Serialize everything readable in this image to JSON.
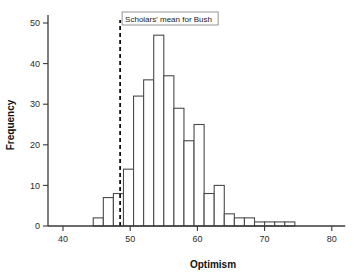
{
  "chart_data": {
    "type": "bar",
    "title": "",
    "subtitle": "",
    "xlabel": "Optimism",
    "ylabel": "Frequency",
    "xlim": [
      37,
      82
    ],
    "ylim": [
      0,
      52
    ],
    "xticks": [
      40,
      50,
      60,
      70,
      80
    ],
    "xtick_labels": [
      "40",
      "50",
      "60",
      "70",
      "80"
    ],
    "yticks": [
      0,
      10,
      20,
      30,
      40,
      50
    ],
    "ytick_labels": [
      "0",
      "10",
      "20",
      "30",
      "40",
      "50"
    ],
    "grid": false,
    "legend": null,
    "bin_width": 1.5,
    "bin_starts": [
      44.5,
      46.0,
      47.5,
      49.0,
      50.5,
      52.0,
      53.5,
      55.0,
      56.5,
      58.0,
      59.5,
      61.0,
      62.5,
      64.0,
      65.5,
      67.0,
      68.5,
      70.0,
      71.5,
      73.0
    ],
    "categories": [
      "44.5",
      "46.0",
      "47.5",
      "49.0",
      "50.5",
      "52.0",
      "53.5",
      "55.0",
      "56.5",
      "58.0",
      "59.5",
      "61.0",
      "62.5",
      "64.0",
      "65.5",
      "67.0",
      "68.5",
      "70.0",
      "71.5",
      "73.0"
    ],
    "values": [
      2,
      7,
      8,
      14,
      32,
      36,
      47,
      37,
      29,
      21,
      25,
      8,
      10,
      3,
      2,
      2,
      1,
      1,
      1,
      1
    ],
    "annotations": [
      {
        "kind": "vertical-reference-line",
        "label": "Scholars' mean for Bush",
        "x": 48.5,
        "style": "dashed",
        "color": "#111111"
      }
    ]
  },
  "axes": {
    "x_title": "Optimism",
    "y_title": "Frequency"
  },
  "annotation": {
    "label": "Scholars' mean for Bush"
  },
  "colors": {
    "bar_fill": "#ffffff",
    "bar_stroke": "#4a4a4a",
    "axis": "#3a3a3a",
    "reference_line": "#111111",
    "text": "#111111",
    "background": "#ffffff"
  }
}
